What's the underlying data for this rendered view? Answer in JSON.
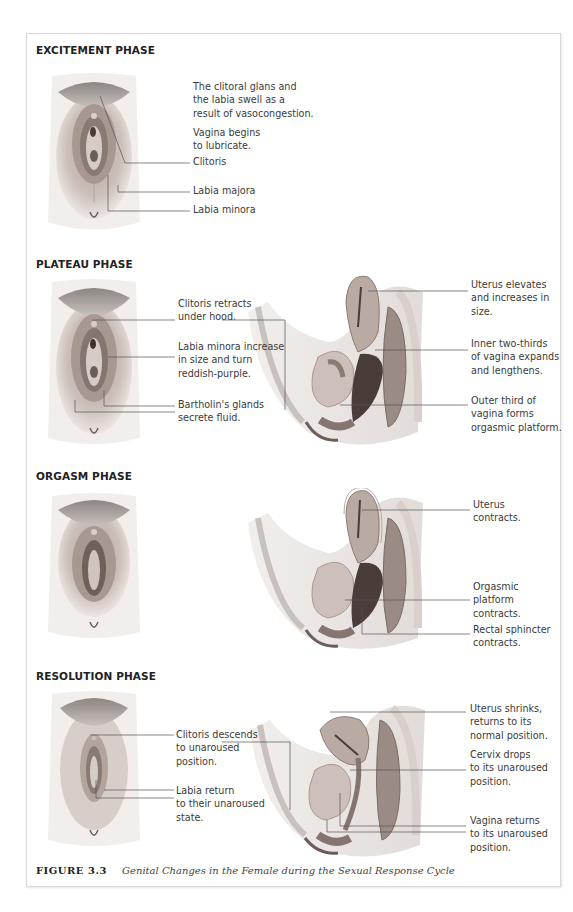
{
  "figure": {
    "number": "FIGURE 3.3",
    "caption": "Genital Changes in the Female during the Sexual Response Cycle"
  },
  "phases": [
    {
      "title": "EXCITEMENT PHASE",
      "frontal_labels": [
        "The clitoral glans and\nthe labia swell as a\nresult of vasocongestion.",
        "Vagina begins\nto lubricate.",
        "Clitoris",
        "Labia majora",
        "Labia minora"
      ],
      "sagittal_labels": []
    },
    {
      "title": "PLATEAU PHASE",
      "frontal_labels": [
        "Clitoris retracts\nunder hood.",
        "Labia minora increase\nin size and turn\nreddish-purple.",
        "Bartholin's glands\nsecrete fluid."
      ],
      "sagittal_labels": [
        "Uterus elevates\nand increases in\nsize.",
        "Inner two-thirds\nof vagina expands\nand lengthens.",
        "Outer third of\nvagina forms\norgasmic platform."
      ]
    },
    {
      "title": "ORGASM PHASE",
      "frontal_labels": [],
      "sagittal_labels": [
        "Uterus\ncontracts.",
        "Orgasmic\nplatform\ncontracts.",
        "Rectal sphincter\ncontracts."
      ]
    },
    {
      "title": "RESOLUTION PHASE",
      "frontal_labels": [
        "Clitoris descends\nto unaroused\nposition.",
        "Labia return\nto their unaroused\nstate."
      ],
      "sagittal_labels": [
        "Uterus shrinks,\nreturns to its\nnormal position.",
        "Cervix drops\nto its unaroused\nposition.",
        "Vagina returns\nto its unaroused\nposition."
      ]
    }
  ],
  "colors": {
    "frame_border": "#d8d8d8",
    "leader_line": "#555555",
    "skin_light": "#e9e1dc",
    "skin_mid": "#b9aaa3",
    "tissue_dark": "#4a3c38"
  }
}
